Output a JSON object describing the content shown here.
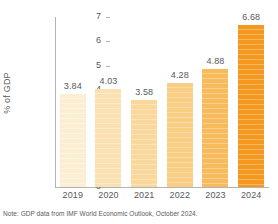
{
  "chart_data": {
    "type": "bar",
    "title": "",
    "subtitle": "",
    "xlabel": "",
    "ylabel": "% of GDP",
    "categories": [
      "2019",
      "2020",
      "2021",
      "2022",
      "2023",
      "2024"
    ],
    "values": [
      3.84,
      4.03,
      3.58,
      4.28,
      4.88,
      6.68
    ],
    "data_labels": [
      "3.84",
      "4.03",
      "3.58",
      "4.28",
      "4.88",
      "6.68"
    ],
    "ylim": [
      0,
      7
    ],
    "ytick_labels": [
      "0",
      "1",
      "2",
      "3",
      "4",
      "5",
      "6",
      "7"
    ],
    "ytick_values": [
      0,
      1,
      2,
      3,
      4,
      5,
      6,
      7
    ],
    "grid": false,
    "legend": null,
    "bar_colors": [
      "#fbeed3",
      "#fbe1b2",
      "#fad79a",
      "#f9cd83",
      "#f7bb5c",
      "#f5981f"
    ],
    "annotations": [
      "Note: GDP data from IMF World Economic Outlook, October 2024."
    ]
  },
  "footnote": {
    "text": "Note: GDP data from IMF World Economic Outlook, October 2024."
  },
  "axis": {
    "line_color": "#b3b3b3",
    "text_color": "#58595b"
  }
}
